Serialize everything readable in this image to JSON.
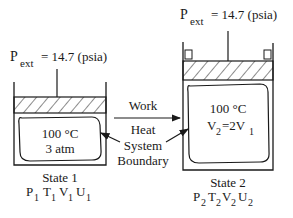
{
  "state1": {
    "pext_label": "P",
    "pext_sub": "ext",
    "pext_value": "= 14.7 (psia)",
    "temperature": "100 °C",
    "pressure": "3 atm",
    "title": "State 1",
    "props": [
      {
        "sym": "P",
        "sub": "1"
      },
      {
        "sym": "T",
        "sub": "1"
      },
      {
        "sym": "V",
        "sub": "1"
      },
      {
        "sym": "U",
        "sub": "1"
      }
    ]
  },
  "state2": {
    "pext_label": "P",
    "pext_sub": "ext",
    "pext_value": "= 14.7 (psia)",
    "temperature": "100 °C",
    "volume_lhs": "V",
    "volume_lhs_sub": "2",
    "volume_rhs": "=2V",
    "volume_rhs_sub": "1",
    "title": "State 2",
    "props": [
      {
        "sym": "P",
        "sub": "2"
      },
      {
        "sym": "T",
        "sub": "2"
      },
      {
        "sym": "V",
        "sub": "2"
      },
      {
        "sym": "U",
        "sub": "2"
      }
    ]
  },
  "process": {
    "work_label": "Work",
    "heat_label": "Heat",
    "boundary_label_1": "System",
    "boundary_label_2": "Boundary"
  },
  "colors": {
    "ink": "#1a1a1a",
    "background": "#ffffff"
  }
}
